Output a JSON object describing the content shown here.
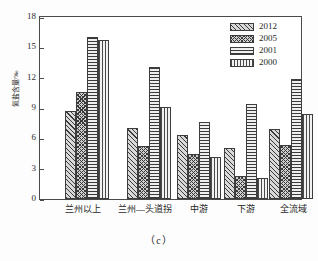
{
  "figure": {
    "caption": "（c）",
    "ylabel": "氮盐含量/‰"
  },
  "legend": {
    "position": "top-right",
    "entries": [
      {
        "label": "2012",
        "pattern": "diagonal-hatch"
      },
      {
        "label": "2005",
        "pattern": "cross-hatch"
      },
      {
        "label": "2001",
        "pattern": "horizontal-lines"
      },
      {
        "label": "2000",
        "pattern": "vertical-lines"
      }
    ]
  },
  "axes": {
    "y_ticks": [
      "0",
      "3",
      "6",
      "9",
      "12",
      "15",
      "18"
    ],
    "x_categories": [
      "兰州以上",
      "兰州—头道拐",
      "中游",
      "下游",
      "全流域"
    ]
  },
  "chart_data": {
    "type": "bar",
    "title": "",
    "subtitle": "",
    "caption": "（c）",
    "xlabel": "",
    "ylabel": "氮盐含量/‰",
    "ylim": [
      0,
      18
    ],
    "yticks": [
      0,
      3,
      6,
      9,
      12,
      15,
      18
    ],
    "grid": false,
    "legend_position": "top-right",
    "categories": [
      "兰州以上",
      "兰州—头道拐",
      "中游",
      "下游",
      "全流域"
    ],
    "series": [
      {
        "name": "2012",
        "values": [
          8.7,
          7.0,
          6.3,
          5.0,
          6.9
        ]
      },
      {
        "name": "2005",
        "values": [
          10.6,
          5.2,
          4.5,
          2.3,
          5.3
        ]
      },
      {
        "name": "2001",
        "values": [
          16.0,
          13.1,
          7.6,
          9.4,
          11.9
        ]
      },
      {
        "name": "2000",
        "values": [
          15.7,
          9.1,
          4.2,
          2.1,
          8.4
        ]
      }
    ]
  }
}
